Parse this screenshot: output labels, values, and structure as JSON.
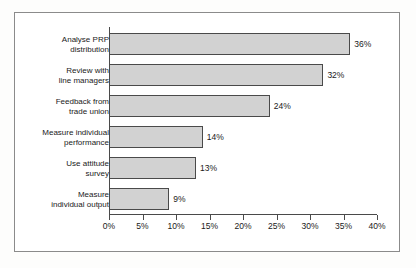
{
  "chart_data": {
    "type": "bar",
    "orientation": "horizontal",
    "title": "",
    "xlabel": "",
    "ylabel": "",
    "xlim": [
      0,
      40
    ],
    "xtick_labels": [
      "0%",
      "5%",
      "10%",
      "15%",
      "20%",
      "25%",
      "30%",
      "35%",
      "40%"
    ],
    "xticks": [
      0,
      5,
      10,
      15,
      20,
      25,
      30,
      35,
      40
    ],
    "grid": false,
    "legend": false,
    "categories": [
      "Analyse PRP distribution",
      "Review with line managers",
      "Feedback from trade union",
      "Measure individual performance",
      "Use attitude survey",
      "Measure individual output"
    ],
    "values": [
      36,
      32,
      24,
      14,
      13,
      9
    ],
    "value_labels": [
      "36%",
      "32%",
      "24%",
      "14%",
      "13%",
      "9%"
    ],
    "bars": [
      {
        "label_line1": "Analyse PRP",
        "label_line2": "distribution",
        "value": 36,
        "value_label": "36%"
      },
      {
        "label_line1": "Review with",
        "label_line2": "line managers",
        "value": 32,
        "value_label": "32%"
      },
      {
        "label_line1": "Feedback from",
        "label_line2": "trade union",
        "value": 24,
        "value_label": "24%"
      },
      {
        "label_line1": "Measure individual",
        "label_line2": "performance",
        "value": 14,
        "value_label": "14%"
      },
      {
        "label_line1": "Use attitude",
        "label_line2": "survey",
        "value": 13,
        "value_label": "13%"
      },
      {
        "label_line1": "Measure",
        "label_line2": "individual output",
        "value": 9,
        "value_label": "9%"
      }
    ],
    "colors": {
      "bar_fill": "#d2d2d2",
      "bar_edge": "#4a4a4a",
      "axis": "#4a4a4a",
      "frame": "#8b8b8b",
      "text": "#1a1a1a",
      "background": "#ffffff"
    }
  }
}
